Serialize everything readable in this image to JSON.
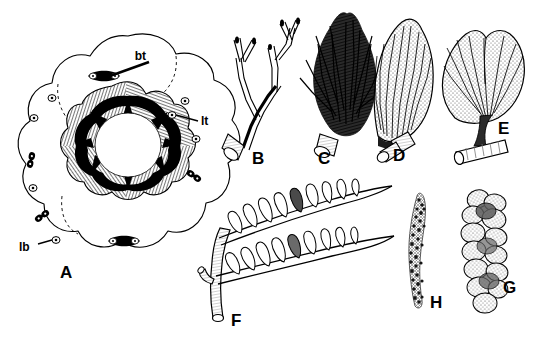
{
  "figure": {
    "type": "scientific-plate",
    "background_color": "#ffffff",
    "ink_color": "#000000",
    "panel_count": 8
  },
  "panels": [
    {
      "letter": "A",
      "name": "cross-section",
      "description": "transverse section of lobed axis with hatched cortex, black medullary spikes and central lumen",
      "letter_pos": {
        "x": 66,
        "y": 272
      },
      "annotations": [
        {
          "code": "bt",
          "x": 152,
          "y": 60,
          "target_x": 104,
          "target_y": 76
        },
        {
          "code": "lt",
          "x": 201,
          "y": 121,
          "target_x": 172,
          "target_y": 115
        },
        {
          "code": "lb",
          "x": 25,
          "y": 247,
          "target_x": 56,
          "target_y": 240
        }
      ]
    },
    {
      "letter": "B",
      "name": "branched-thallus",
      "letter_pos": {
        "x": 258,
        "y": 158
      }
    },
    {
      "letter": "C",
      "name": "bushy-tuft",
      "letter_pos": {
        "x": 323,
        "y": 158
      }
    },
    {
      "letter": "D",
      "name": "elongate-blade",
      "letter_pos": {
        "x": 399,
        "y": 155
      }
    },
    {
      "letter": "E",
      "name": "fan-blade",
      "letter_pos": {
        "x": 504,
        "y": 128
      }
    },
    {
      "letter": "F",
      "name": "pinnate-frond",
      "letter_pos": {
        "x": 237,
        "y": 320
      }
    },
    {
      "letter": "G",
      "name": "bead-chain-segmented",
      "letter_pos": {
        "x": 509,
        "y": 287
      }
    },
    {
      "letter": "H",
      "name": "granular-strand",
      "letter_pos": {
        "x": 436,
        "y": 302
      }
    }
  ],
  "labels": {
    "bt": "bt",
    "lt": "lt",
    "lb": "lb",
    "A": "A",
    "B": "B",
    "C": "C",
    "D": "D",
    "E": "E",
    "F": "F",
    "G": "G",
    "H": "H"
  }
}
